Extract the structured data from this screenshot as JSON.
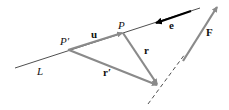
{
  "diagram": {
    "labels": {
      "line": "L",
      "point_p_prime": "P′",
      "point_p": "P",
      "vec_u": "u",
      "vec_r": "r",
      "vec_r_prime": "r′",
      "vec_e": "e",
      "vec_f": "F"
    },
    "colors": {
      "vector": "#8a8a8a",
      "line": "#222222",
      "e_vector": "#000000"
    }
  }
}
